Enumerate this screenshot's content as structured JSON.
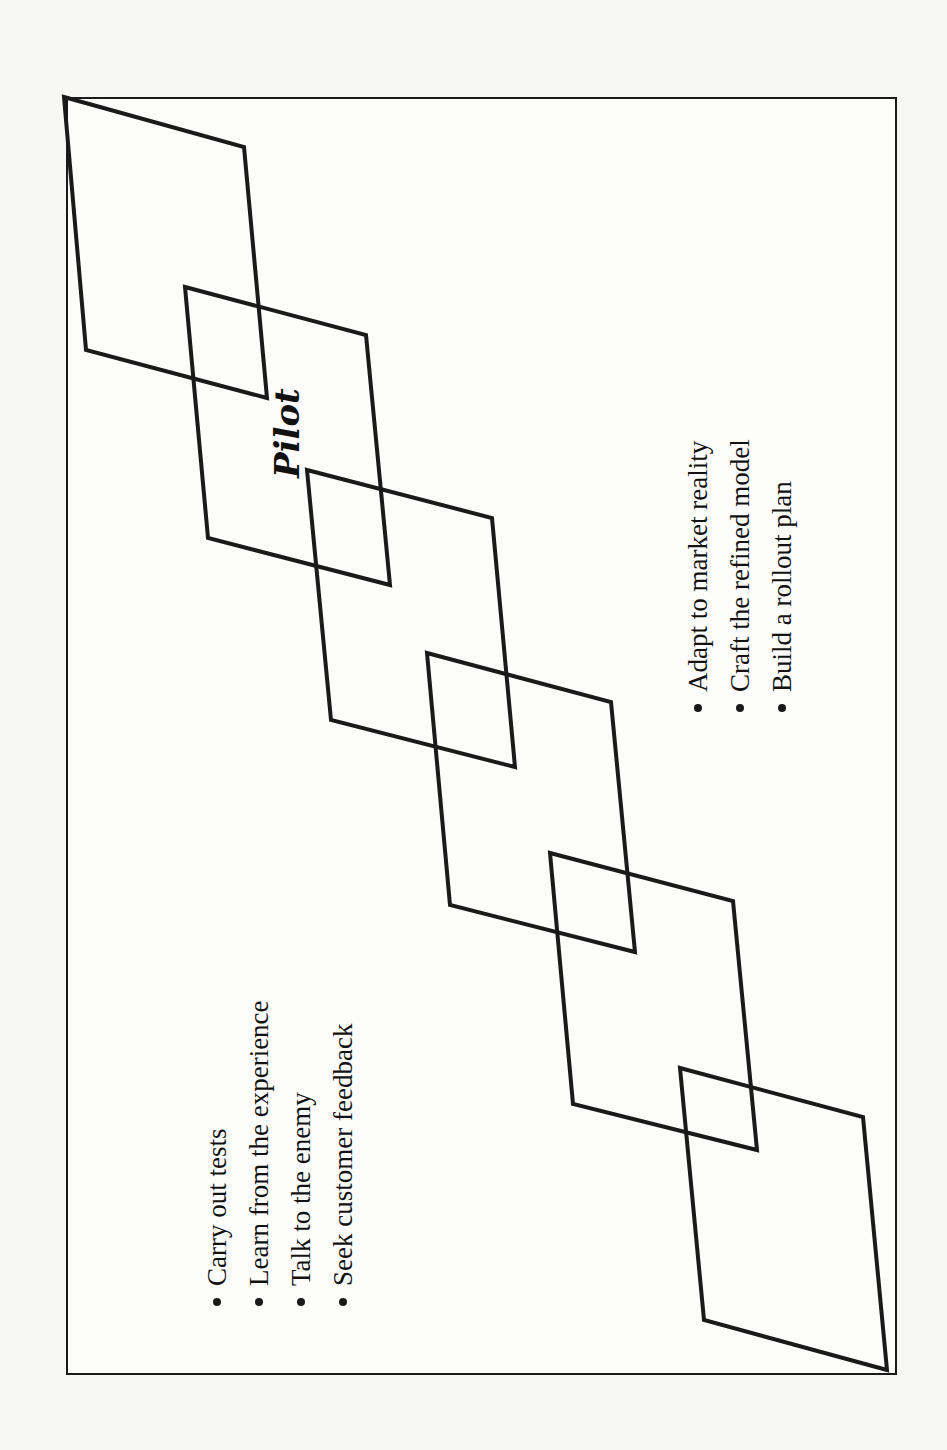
{
  "diagram": {
    "title_label": "Pilot",
    "left_list": {
      "items": [
        "Carry out tests",
        "Learn from the experience",
        "Talk to the enemy",
        "Seek customer feedback"
      ]
    },
    "right_list": {
      "items": [
        "Adapt to market reality",
        "Craft the refined model",
        "Build a rollout plan"
      ]
    },
    "colors": {
      "stroke": "#1a1a1a",
      "background": "#fcfcfb"
    },
    "shapes": [
      {
        "name": "parallelogram-1",
        "points": "64,97 244,147 267,398 86,350"
      },
      {
        "name": "parallelogram-2",
        "points": "185,287 366,335 390,585 208,538"
      },
      {
        "name": "parallelogram-3",
        "points": "307,470 492,518 515,767 331,720"
      },
      {
        "name": "parallelogram-4",
        "points": "427,653 611,702 635,952 450,905"
      },
      {
        "name": "parallelogram-5",
        "points": "550,853 733,901 757,1150 573,1104"
      },
      {
        "name": "parallelogram-6",
        "points": "680,1068 863,1117 887,1370 704,1320"
      }
    ]
  }
}
